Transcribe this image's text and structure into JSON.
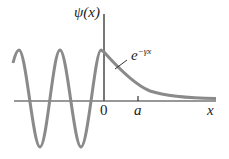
{
  "diagram": {
    "y_axis_label": "ψ(x)",
    "x_axis_label": "x",
    "origin_label": "0",
    "tick_label": "a",
    "decay_label_base": "e",
    "decay_label_exponent": "−γx",
    "colors": {
      "curve": "#8a8a8a",
      "axis": "#333333",
      "text": "#222222"
    }
  }
}
